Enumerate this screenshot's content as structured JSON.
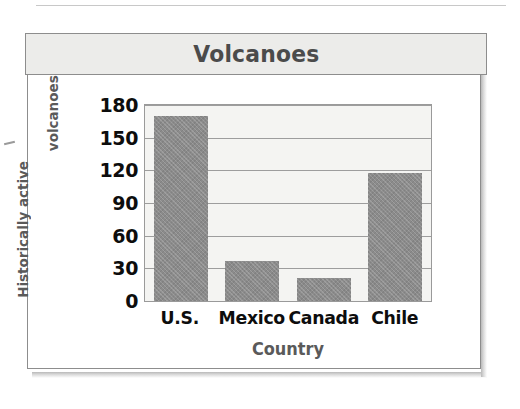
{
  "figure": {
    "title": "Volcanoes"
  },
  "chart_data": {
    "type": "bar",
    "title": "Volcanoes",
    "categories": [
      "U.S.",
      "Mexico",
      "Canada",
      "Chile"
    ],
    "values": [
      170,
      37,
      21,
      118
    ],
    "xlabel": "Country",
    "ylabel": "Historically active volcanoes",
    "ylabel_lines": [
      "Historically active",
      "volcanoes"
    ],
    "ytick_labels": [
      "180",
      "150",
      "120",
      "90",
      "60",
      "30",
      "0"
    ],
    "ytick_values": [
      180,
      150,
      120,
      90,
      60,
      30,
      0
    ],
    "ylim": [
      0,
      180
    ],
    "ytick_step": 30,
    "grid": "horizontal",
    "legend": "none",
    "bar_color": "#8b8b8b",
    "plot_background": "#f4f4f2",
    "gridline_color": "#9d9d9d",
    "title_color": "#4b4b4b",
    "axis_title_color": "#5a5a5a",
    "tick_label_color": "#0d0d0d"
  }
}
